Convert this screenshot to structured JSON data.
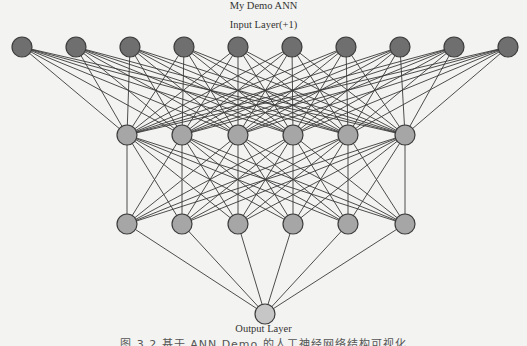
{
  "title": "My Demo ANN",
  "input_layer_label": "Input Layer(+1)",
  "output_layer_label": "Output Layer",
  "caption": "图 3.2 基于 ANN Demo 的人工神经网络结构可视化",
  "colors": {
    "background": "#f3f3f1",
    "edge": "#3a3a3a",
    "node_stroke": "#3c3c3c",
    "input_fill": "#6f6f6f",
    "hidden_fill": "#a6a6a6",
    "output_fill": "#c6c6c6"
  },
  "network": {
    "node_radius": 10,
    "layers": [
      {
        "name": "input",
        "count": 10,
        "y": 47,
        "x": [
          22,
          76,
          130,
          184,
          238,
          292,
          346,
          400,
          454,
          508
        ],
        "fill": "input_fill"
      },
      {
        "name": "hidden1",
        "count": 6,
        "y": 135,
        "x": [
          127,
          182,
          238,
          293,
          348,
          405
        ],
        "fill": "hidden_fill"
      },
      {
        "name": "hidden2",
        "count": 6,
        "y": 224,
        "x": [
          127,
          182,
          238,
          293,
          348,
          405
        ],
        "fill": "hidden_fill"
      },
      {
        "name": "output",
        "count": 1,
        "y": 314,
        "x": [
          265
        ],
        "fill": "output_fill"
      }
    ]
  }
}
